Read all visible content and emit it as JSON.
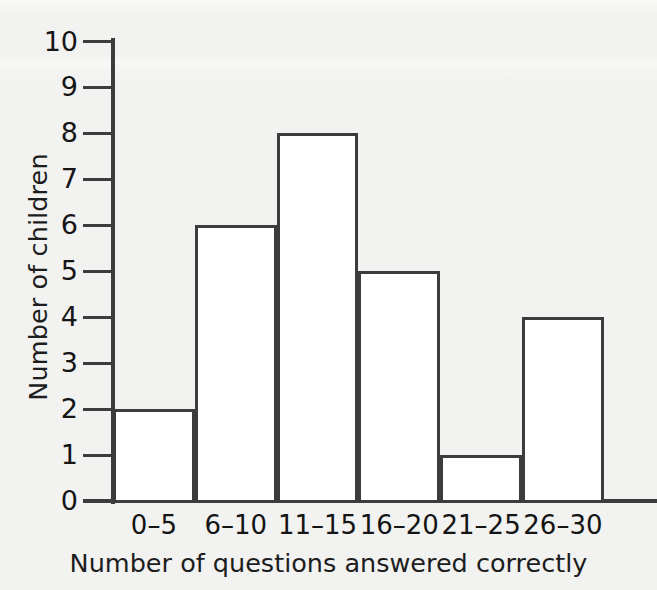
{
  "chart_data": {
    "type": "bar",
    "title": "",
    "subtitle": "",
    "xlabel": "Number of questions answered correctly",
    "ylabel": "Number of children",
    "categories": [
      "0–5",
      "6–10",
      "11–15",
      "16–20",
      "21–25",
      "26–30"
    ],
    "values": [
      2,
      6,
      8,
      5,
      1,
      4
    ],
    "series": [
      {
        "name": "Number of children",
        "values": [
          2,
          6,
          8,
          5,
          1,
          4
        ]
      }
    ],
    "ylim": [
      0,
      10
    ],
    "y_ticks": [
      0,
      1,
      2,
      3,
      4,
      5,
      6,
      7,
      8,
      9,
      10
    ],
    "y_tick_labels": [
      "0",
      "1",
      "2",
      "3",
      "4",
      "5",
      "6",
      "7",
      "8",
      "9",
      "10"
    ],
    "grid": false,
    "legend": false,
    "legend_position": "none",
    "bar_gap": 0,
    "annotations": []
  },
  "style": {
    "background_color": "#f2f2f0",
    "bar_fill_color": "#ffffff",
    "bar_stroke_color": "#3c3c3c",
    "axis_color": "#3c3c3c",
    "text_color": "#1a1a1a"
  }
}
